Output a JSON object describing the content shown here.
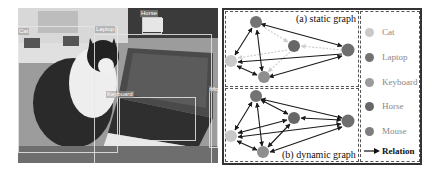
{
  "photo": {
    "description": "grayscale photo of a cat sitting next to an open laptop on a desk",
    "boxes": [
      {
        "label": "Cat",
        "x": 0,
        "y": 18,
        "w": 120,
        "h": 127
      },
      {
        "label": "Laptop",
        "x": 93,
        "y": 26,
        "w": 25,
        "h": 134
      },
      {
        "label": "Horse",
        "x": 124,
        "y": 9,
        "w": 20,
        "h": 17
      },
      {
        "label": "Keyboard",
        "x": 101,
        "y": 89,
        "w": 77,
        "h": 44
      },
      {
        "label": "Mo",
        "x": 191,
        "y": 80,
        "w": 9,
        "h": 60
      }
    ]
  },
  "graphs": {
    "static": {
      "title": "(a) static graph"
    },
    "dynamic": {
      "title": "(b) dynamic graph"
    }
  },
  "legend": {
    "items": [
      {
        "label": "Cat",
        "color": "#c9c9c9"
      },
      {
        "label": "Laptop",
        "color": "#737373"
      },
      {
        "label": "Keyboard",
        "color": "#9b9b9b"
      },
      {
        "label": "Horse",
        "color": "#676767"
      },
      {
        "label": "Mouse",
        "color": "#7e7e7e"
      }
    ],
    "relation_label": "Relation"
  },
  "colors": {
    "edge_solid": "#1a1a1a",
    "edge_dashed": "#cfcfcf",
    "frame": "#333333"
  }
}
